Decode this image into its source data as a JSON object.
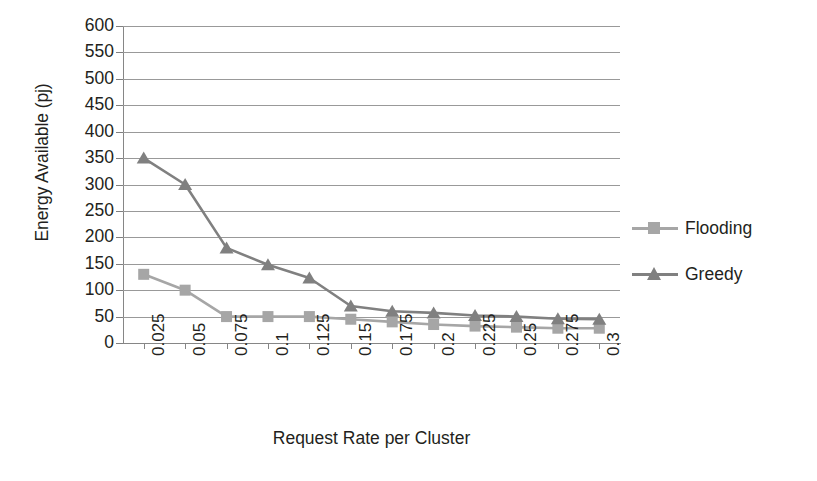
{
  "chart_data": {
    "type": "line",
    "title": "",
    "xlabel": "Request Rate per Cluster",
    "ylabel": "Energy Available (pj)",
    "categories": [
      "0.025",
      "0.05",
      "0.075",
      "0.1",
      "0.125",
      "0.15",
      "0.175",
      "0.2",
      "0.225",
      "0.25",
      "0.275",
      "0.3"
    ],
    "ylim": [
      0,
      600
    ],
    "ytick_step": 50,
    "yticks": [
      "600",
      "550",
      "500",
      "450",
      "400",
      "350",
      "300",
      "250",
      "200",
      "150",
      "100",
      "50",
      "0"
    ],
    "grid": true,
    "legend_position": "right",
    "series": [
      {
        "name": "Flooding",
        "color": "#a6a6a6",
        "marker": "square",
        "values": [
          130,
          100,
          50,
          50,
          50,
          45,
          40,
          35,
          32,
          30,
          28,
          28
        ]
      },
      {
        "name": "Greedy",
        "color": "#808080",
        "marker": "triangle",
        "values": [
          350,
          300,
          180,
          148,
          123,
          70,
          60,
          57,
          52,
          50,
          46,
          45
        ]
      }
    ]
  },
  "legend": {
    "items": [
      {
        "label": "Flooding"
      },
      {
        "label": "Greedy"
      }
    ]
  },
  "colors": {
    "flooding": "#a6a6a6",
    "greedy": "#808080",
    "gridline": "#999999",
    "axis": "#868686",
    "text": "#231f20",
    "background": "#ffffff"
  }
}
